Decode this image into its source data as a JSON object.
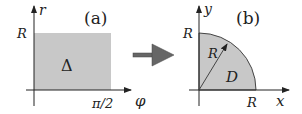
{
  "panel_a": {
    "label": "(a)",
    "y_axis_label": "r",
    "x_axis_label": "φ",
    "y_tick": "R",
    "x_tick": "π/2",
    "region_label": "Δ",
    "region_color": "#c8c8c8"
  },
  "arrow": {
    "color": "#666666"
  },
  "panel_b": {
    "label": "(b)",
    "y_axis_label": "y",
    "x_axis_label": "x",
    "y_tick": "R",
    "x_tick": "R",
    "radius_label": "R",
    "region_label": "D",
    "region_color": "#c8c8c8"
  }
}
